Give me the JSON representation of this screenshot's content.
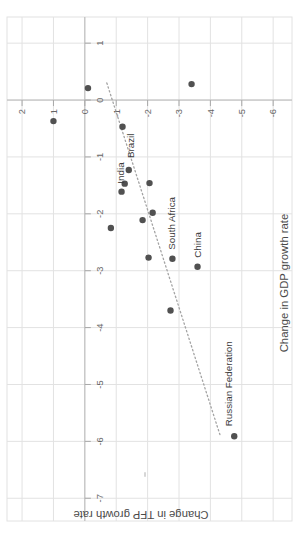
{
  "figure": {
    "orientation_note": "entire chart rotated 90 degrees counter-clockwise",
    "background": "#ffffff"
  },
  "chart_data": {
    "type": "scatter",
    "title": "",
    "xlabel": "Change in GDP growth rate",
    "ylabel": "Change in TFP growth rate",
    "x_ticks": [
      1,
      0,
      -1,
      -2,
      -3,
      -4,
      -5,
      -6,
      -7
    ],
    "y_ticks": [
      2,
      1,
      0,
      -1,
      -2,
      -3,
      -4,
      -5,
      -6
    ],
    "xlim": [
      -7.4,
      1.46
    ],
    "ylim": [
      -6.6,
      2.48
    ],
    "grid": "on",
    "axes_cross_at_zero": true,
    "points": [
      {
        "x": -0.37,
        "y": 1.0
      },
      {
        "x": 0.21,
        "y": -0.1
      },
      {
        "x": 0.28,
        "y": -3.4
      },
      {
        "x": -0.47,
        "y": -1.2
      },
      {
        "x": -1.23,
        "y": -1.4,
        "label": "Brazil",
        "label_dx": 12,
        "label_dy": 5
      },
      {
        "x": -1.47,
        "y": -1.27
      },
      {
        "x": -1.61,
        "y": -1.17,
        "label": "India",
        "label_dx": 8,
        "label_dy": 2.5
      },
      {
        "x": -1.46,
        "y": -2.06
      },
      {
        "x": -1.98,
        "y": -2.16
      },
      {
        "x": -2.11,
        "y": -1.84
      },
      {
        "x": -2.25,
        "y": -0.83
      },
      {
        "x": -2.77,
        "y": -2.03
      },
      {
        "x": -2.79,
        "y": -2.79,
        "label": "South Africa",
        "label_dx": 9,
        "label_dy": 3
      },
      {
        "x": -2.93,
        "y": -3.59,
        "label": "China",
        "label_dx": 9,
        "label_dy": 3
      },
      {
        "x": -3.7,
        "y": -2.73
      },
      {
        "x": -5.91,
        "y": -4.76,
        "label": "Russian Federation",
        "label_dx": 10,
        "label_dy": -2
      }
    ],
    "trendline": {
      "style": "dotted",
      "x1": 0.3,
      "y1": -0.7,
      "x2": -5.91,
      "y2": -4.32
    },
    "colors": {
      "point": "#515151",
      "grid": "#e2e2e2",
      "axis": "#b8b8b8",
      "tick": "#a8a8a8",
      "trend": "#a3a3a3",
      "stray_mark": "#d6d6d6"
    }
  }
}
